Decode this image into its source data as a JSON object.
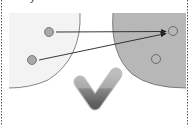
{
  "diagram": {
    "caption": "y",
    "left_region": {
      "label": "source-set",
      "fill": "#f3f3f3",
      "stroke": "#777777"
    },
    "right_region": {
      "label": "target-set",
      "fill": "#b7b7b7",
      "stroke": "#777777"
    },
    "points": [
      {
        "id": "p1",
        "x": 49,
        "y": 32,
        "style": "filled"
      },
      {
        "id": "p2",
        "x": 32,
        "y": 60,
        "style": "filled"
      },
      {
        "id": "q1",
        "x": 173,
        "y": 31,
        "style": "hollow"
      },
      {
        "id": "q2",
        "x": 156,
        "y": 59,
        "style": "hollow"
      }
    ],
    "arrows": [
      {
        "from": "p1",
        "to": "q1"
      },
      {
        "from": "p2",
        "to": "q1"
      }
    ],
    "status_icon": "checkmark-icon",
    "colors": {
      "point_fill": "#a8a8a8",
      "point_stroke": "#666666",
      "arrow": "#222222",
      "check_top": "#b0b0b0",
      "check_bottom": "#6a6a6a",
      "border": "#555555"
    }
  }
}
